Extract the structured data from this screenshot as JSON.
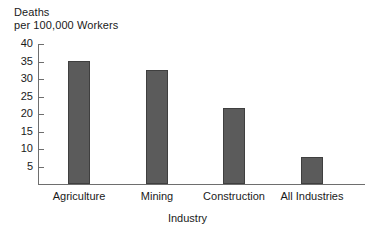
{
  "chart_data": {
    "type": "bar",
    "title": "",
    "subtitle": "",
    "ylabel_line1": "Deaths",
    "ylabel_line2": "per 100,000 Workers",
    "ylabel": "Deaths per 100,000 Workers",
    "xlabel": "Industry",
    "categories": [
      "Agriculture",
      "Mining",
      "Construction",
      "All Industries"
    ],
    "values": [
      35.2,
      32.6,
      21.8,
      7.6
    ],
    "ylim": [
      0,
      40
    ],
    "ytick_labels": [
      "40",
      "35",
      "30",
      "25",
      "20",
      "15",
      "10",
      "5"
    ],
    "ytick_values": [
      40,
      35,
      30,
      25,
      20,
      15,
      10,
      5
    ],
    "grid": false,
    "legend": "none",
    "series": [
      {
        "name": "Deaths per 100,000 Workers",
        "values": [
          35.2,
          32.6,
          21.8,
          7.6
        ]
      }
    ],
    "colors": {
      "bar_fill": "#5b5b5b",
      "bar_border": "#3f3f3f",
      "axis": "#6e6e6e",
      "text": "#1a1a1a",
      "background": "#ffffff"
    }
  }
}
